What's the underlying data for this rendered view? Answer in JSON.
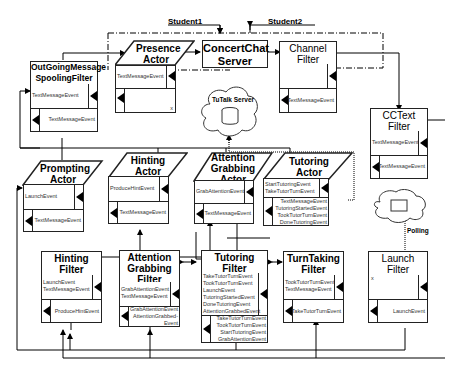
{
  "students": {
    "student1": "Student1",
    "student2": "Student2"
  },
  "server": {
    "title_line1": "ConcertChat",
    "title_line2": "Server"
  },
  "presence_actor": {
    "title_line1": "Presence",
    "title_line2": "Actor",
    "in_events": [
      "TextMessageEvent"
    ],
    "out_events": [],
    "corner": "x"
  },
  "channel_filter": {
    "title_line1": "Channel",
    "title_line2": "Filter",
    "in_events": [],
    "out_events": [
      "TextMessageEvent"
    ]
  },
  "outgoing_filter": {
    "title_line1": "OutGoingMessage",
    "title_line2": "SpoolingFilter",
    "in_events": [
      "TextMessageEvent"
    ],
    "out_events": [
      "TextMessageEvent"
    ]
  },
  "tutalk_server": {
    "label": "TuTalk Server"
  },
  "cctext_filter": {
    "title_line1": "CCText",
    "title_line2": "Filter",
    "in_events": [
      "TextMessageEvent"
    ],
    "out_events": [
      "TextMessageEvent"
    ]
  },
  "polling": {
    "label": "Polling"
  },
  "prompting_actor": {
    "title_line1": "Prompting",
    "title_line2": "Actor",
    "in_events": [
      "LaunchEvent"
    ],
    "out_events": [
      "TextMessageEvent"
    ]
  },
  "hinting_actor": {
    "title_line1": "Hinting",
    "title_line2": "Actor",
    "in_events": [
      "ProduceHintEvent"
    ],
    "out_events": [
      "TextMessageEvent"
    ]
  },
  "attention_actor": {
    "title_line1": "Attention",
    "title_line2": "Grabbing",
    "title_line3": "Actor",
    "in_events": [
      "GrabAttentionEvent"
    ],
    "out_events": [
      "TextMessageEvent"
    ]
  },
  "tutoring_actor": {
    "title_line1": "Tutoring",
    "title_line2": "Actor",
    "in_events": [
      "StartTutoringEvent",
      "TakeTutorTurnEvent"
    ],
    "out_events": [
      "TextMessageEvent",
      "TutoringStartedEvent",
      "TookTutorTurnEvent",
      "DoneTutoringEvent"
    ]
  },
  "hinting_filter": {
    "title_line1": "Hinting",
    "title_line2": "Filter",
    "in_events": [
      "LaunchEvent",
      "TextMessageEvent"
    ],
    "out_events": [
      "ProduceHintEvent"
    ]
  },
  "attention_filter": {
    "title_line1": "Attention",
    "title_line2": "Grabbing",
    "title_line3": "Filter",
    "in_events": [
      "GrabAttentionEvent",
      "TextMessageEvent"
    ],
    "out_events": [
      "GrabAttentionEvent",
      "AttentionGrabbed-",
      "Event"
    ]
  },
  "tutoring_filter": {
    "title_line1": "Tutoring",
    "title_line2": "Filter",
    "in_events": [
      "TakeTutorTurnEvent",
      "TookTutorTurnEvent",
      "LaunchEvent",
      "TutoringStartedEvent",
      "DoneTutoringEvent",
      "AttentionGrabbedEvent"
    ],
    "out_events": [
      "TakeTutorTurnEvent",
      "TookTutorTurnEvent",
      "StartTutoringEvent",
      "GrabAttentionEvent"
    ]
  },
  "turntaking_filter": {
    "title_line1": "TurnTaking",
    "title_line2": "Filter",
    "in_events": [
      "TookTutorTurnEvent",
      "TextMessageEvent"
    ],
    "out_events": [
      "TakeTutorTurnEvent"
    ]
  },
  "launch_filter": {
    "title_line1": "Launch",
    "title_line2": "Filter",
    "in_events": [],
    "out_events": [
      "LaunchEvent"
    ],
    "corner": "x"
  }
}
